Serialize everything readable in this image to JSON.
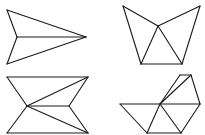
{
  "figure": {
    "stroke_color": "#1a1a1a",
    "background": "#ffffff"
  },
  "shapes": [
    {
      "name": "arrowhead",
      "segments": [
        [
          7,
          10,
          86,
          37
        ],
        [
          7,
          10,
          17,
          37
        ],
        [
          17,
          37,
          7,
          64
        ],
        [
          7,
          64,
          86,
          37
        ],
        [
          17,
          37,
          86,
          37
        ]
      ]
    },
    {
      "name": "cup",
      "segments": [
        [
          123,
          6,
          158,
          26
        ],
        [
          158,
          26,
          200,
          6
        ],
        [
          123,
          6,
          141,
          64
        ],
        [
          200,
          6,
          182,
          64
        ],
        [
          141,
          64,
          182,
          64
        ],
        [
          158,
          26,
          141,
          64
        ],
        [
          158,
          26,
          182,
          64
        ]
      ]
    },
    {
      "name": "bowtie",
      "segments": [
        [
          7,
          77,
          88,
          77
        ],
        [
          7,
          133,
          88,
          133
        ],
        [
          7,
          77,
          27,
          106
        ],
        [
          27,
          106,
          7,
          133
        ],
        [
          88,
          77,
          69,
          106
        ],
        [
          69,
          106,
          88,
          133
        ],
        [
          27,
          106,
          88,
          77
        ],
        [
          27,
          106,
          69,
          106
        ],
        [
          27,
          106,
          88,
          133
        ]
      ]
    },
    {
      "name": "fan",
      "segments": [
        [
          120,
          104,
          200,
          104
        ],
        [
          120,
          104,
          147,
          133
        ],
        [
          147,
          133,
          181,
          133
        ],
        [
          181,
          133,
          200,
          104
        ],
        [
          160,
          104,
          147,
          133
        ],
        [
          160,
          104,
          181,
          133
        ],
        [
          160,
          104,
          180,
          75
        ],
        [
          180,
          75,
          191,
          75
        ],
        [
          191,
          75,
          200,
          104
        ],
        [
          160,
          104,
          191,
          75
        ]
      ]
    }
  ]
}
